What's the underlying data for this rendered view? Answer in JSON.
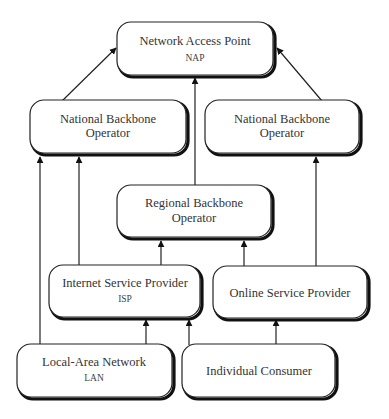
{
  "diagram": {
    "type": "hierarchy",
    "nodes": [
      {
        "id": "nap",
        "label": "Network Access Point",
        "sublabel": "NAP"
      },
      {
        "id": "nbo_left",
        "label": "National Backbone",
        "label2": "Operator"
      },
      {
        "id": "nbo_right",
        "label": "National Backbone",
        "label2": "Operator"
      },
      {
        "id": "rbo",
        "label": "Regional Backbone",
        "label2": "Operator"
      },
      {
        "id": "isp",
        "label": "Internet Service Provider",
        "sublabel": "ISP"
      },
      {
        "id": "osp",
        "label": "Online Service Provider"
      },
      {
        "id": "lan",
        "label": "Local-Area Network",
        "sublabel": "LAN"
      },
      {
        "id": "consumer",
        "label": "Individual Consumer"
      }
    ],
    "edges": [
      {
        "from": "nbo_left",
        "to": "nap"
      },
      {
        "from": "rbo",
        "to": "nap"
      },
      {
        "from": "nbo_right",
        "to": "nap"
      },
      {
        "from": "lan",
        "to": "nbo_left"
      },
      {
        "from": "isp",
        "to": "nbo_left"
      },
      {
        "from": "osp",
        "to": "nbo_right"
      },
      {
        "from": "isp",
        "to": "rbo"
      },
      {
        "from": "osp",
        "to": "rbo"
      },
      {
        "from": "lan",
        "to": "isp"
      },
      {
        "from": "consumer",
        "to": "isp"
      },
      {
        "from": "consumer",
        "to": "osp"
      }
    ]
  }
}
